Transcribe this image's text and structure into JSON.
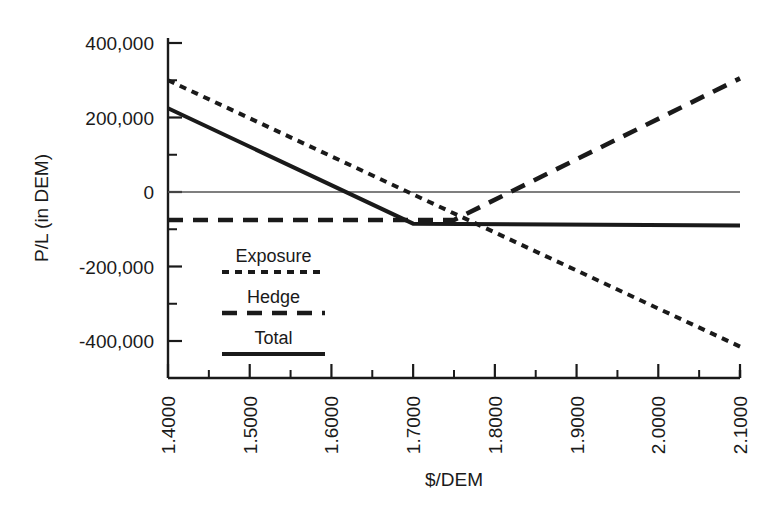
{
  "chart_data": {
    "type": "line",
    "title": "",
    "xlabel": "$/DEM",
    "ylabel": "P/L (in DEM)",
    "xlim": [
      1.4,
      2.1
    ],
    "ylim": [
      -450000,
      400000
    ],
    "xticks": [
      "1.4000",
      "1.5000",
      "1.6000",
      "1.7000",
      "1.8000",
      "1.9000",
      "2.0000",
      "2.1000"
    ],
    "xtick_values": [
      1.4,
      1.5,
      1.6,
      1.7,
      1.8,
      1.9,
      2.0,
      2.1
    ],
    "x_minor_step": 0.05,
    "yticks": [
      "400,000",
      "200,000",
      "0",
      "-200,000",
      "-400,000"
    ],
    "ytick_values": [
      400000,
      200000,
      0,
      -200000,
      -400000
    ],
    "y_minor_step": 100000,
    "grid": false,
    "zero_line": true,
    "legend_position": "inner-left",
    "series": [
      {
        "name": "Exposure",
        "style": "dotted",
        "x": [
          1.4,
          2.1
        ],
        "values": [
          300000,
          -415000
        ]
      },
      {
        "name": "Hedge",
        "style": "dashed",
        "x": [
          1.4,
          1.75,
          2.1
        ],
        "values": [
          -75000,
          -75000,
          305000
        ]
      },
      {
        "name": "Total",
        "style": "solid",
        "x": [
          1.4,
          1.7,
          2.1
        ],
        "values": [
          225000,
          -85000,
          -90000
        ]
      }
    ]
  },
  "legend": {
    "items": [
      {
        "label": "Exposure",
        "style": "dotted"
      },
      {
        "label": "Hedge",
        "style": "dashed"
      },
      {
        "label": "Total",
        "style": "solid"
      }
    ]
  },
  "axes": {
    "x_title": "$/DEM",
    "y_title": "P/L (in DEM)"
  },
  "colors": {
    "ink": "#1a1a1a",
    "axis": "#1a1a1a",
    "zero_line": "#555555",
    "background": "#ffffff"
  }
}
